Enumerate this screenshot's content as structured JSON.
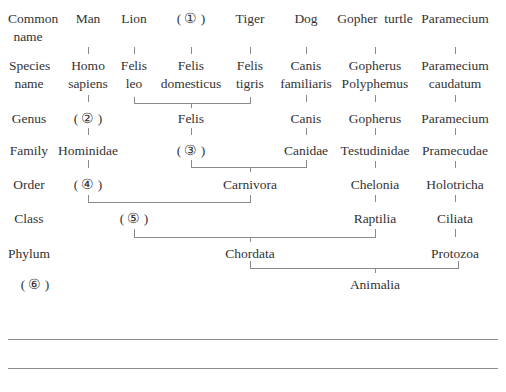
{
  "diagram": {
    "type": "taxonomy-tree",
    "rank_labels": {
      "common_name": "Common\nname",
      "species_name": "Species\nname",
      "genus": "Genus",
      "family": "Family",
      "order": "Order",
      "class": "Class",
      "phylum": "Phylum",
      "kingdom": "( ⑥ )"
    },
    "columns": [
      {
        "common": "Man",
        "species": "Homo\nsapiens"
      },
      {
        "common": "Lion",
        "species": "Felis\nleo"
      },
      {
        "common": "( ① )",
        "species": "Felis\ndomesticus"
      },
      {
        "common": "Tiger",
        "species": "Felis\ntigris"
      },
      {
        "common": "Dog",
        "species": "Canis\nfamiliaris"
      },
      {
        "common": "Gopher  turtle",
        "species": "Gopherus\nPolyphemus"
      },
      {
        "common": "Paramecium",
        "species": "Paramecium\ncaudatum"
      }
    ],
    "genus": {
      "man": "( ② )",
      "cats": "Felis",
      "dog": "Canis",
      "turtle": "Gopherus",
      "paramecium": "Paramecium"
    },
    "family": {
      "man": "Hominidae",
      "cats": "( ③ )",
      "dog": "Canidae",
      "turtle": "Testudinidae",
      "paramecium": "Pramecudae"
    },
    "order": {
      "man": "( ④ )",
      "carnivores": "Carnivora",
      "turtle": "Chelonia",
      "paramecium": "Holotricha"
    },
    "class": {
      "mammals": "( ⑤ )",
      "turtle": "Raptilia",
      "paramecium": "Ciliata"
    },
    "phylum": {
      "chordates": "Chordata",
      "paramecium": "Protozoa"
    },
    "kingdom": {
      "all": "Animalia"
    },
    "blanks": [
      "①",
      "②",
      "③",
      "④",
      "⑤",
      "⑥"
    ]
  }
}
